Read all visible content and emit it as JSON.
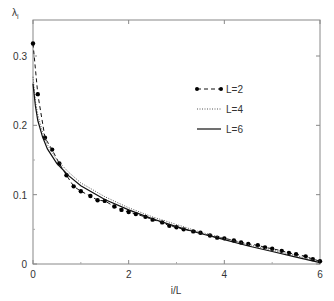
{
  "chart_data": {
    "type": "line",
    "title": "",
    "xlabel": "i/L",
    "ylabel": "λ_i",
    "xlim": [
      0,
      6
    ],
    "ylim": [
      0,
      0.35
    ],
    "xticks": [
      0,
      2,
      4,
      6
    ],
    "xtick_labels": [
      "0",
      "2",
      "4",
      "6"
    ],
    "yticks": [
      0,
      0.1,
      0.2,
      0.3
    ],
    "ytick_labels": [
      "0",
      "0.1",
      "0.2",
      "0.3"
    ],
    "grid": false,
    "legend_position": "upper right (inside)",
    "series": [
      {
        "name": "L=2",
        "style": "dashed with filled circle markers",
        "x": [
          0,
          0.1,
          0.25,
          0.4,
          0.55,
          0.7,
          0.85,
          1.0,
          1.2,
          1.35,
          1.5,
          1.7,
          1.85,
          2.0,
          2.15,
          2.35,
          2.5,
          2.7,
          2.85,
          3.0,
          3.15,
          3.35,
          3.5,
          3.7,
          3.85,
          4.0,
          4.2,
          4.35,
          4.5,
          4.7,
          4.85,
          5.0,
          5.2,
          5.35,
          5.5,
          5.7,
          5.85,
          6.0
        ],
        "y": [
          0.318,
          0.245,
          0.182,
          0.165,
          0.145,
          0.128,
          0.112,
          0.105,
          0.098,
          0.092,
          0.091,
          0.083,
          0.078,
          0.075,
          0.072,
          0.068,
          0.064,
          0.06,
          0.055,
          0.053,
          0.05,
          0.047,
          0.045,
          0.041,
          0.038,
          0.037,
          0.034,
          0.031,
          0.029,
          0.027,
          0.024,
          0.022,
          0.019,
          0.016,
          0.014,
          0.011,
          0.007,
          0.004
        ]
      },
      {
        "name": "L=4",
        "style": "dotted",
        "x": [
          0,
          0.05,
          0.1,
          0.2,
          0.3,
          0.5,
          0.75,
          1.0,
          1.5,
          2.0,
          2.5,
          3.0,
          3.5,
          4.0,
          4.5,
          5.0,
          5.5,
          6.0
        ],
        "y": [
          0.27,
          0.235,
          0.215,
          0.19,
          0.172,
          0.15,
          0.132,
          0.117,
          0.097,
          0.081,
          0.068,
          0.057,
          0.046,
          0.037,
          0.028,
          0.02,
          0.012,
          0.004
        ]
      },
      {
        "name": "L=6",
        "style": "solid",
        "x": [
          0,
          0.05,
          0.1,
          0.2,
          0.3,
          0.5,
          0.75,
          1.0,
          1.5,
          2.0,
          2.5,
          3.0,
          3.5,
          4.0,
          4.5,
          5.0,
          5.5,
          6.0
        ],
        "y": [
          0.26,
          0.228,
          0.207,
          0.183,
          0.166,
          0.145,
          0.127,
          0.113,
          0.093,
          0.078,
          0.065,
          0.054,
          0.044,
          0.035,
          0.026,
          0.018,
          0.01,
          0.002
        ]
      }
    ]
  },
  "legend": {
    "items": [
      {
        "label": "L=2"
      },
      {
        "label": "L=4"
      },
      {
        "label": "L=6"
      }
    ]
  },
  "axes": {
    "xlabel": "i/L",
    "ylabel_main": "λ",
    "ylabel_sub": "i"
  }
}
